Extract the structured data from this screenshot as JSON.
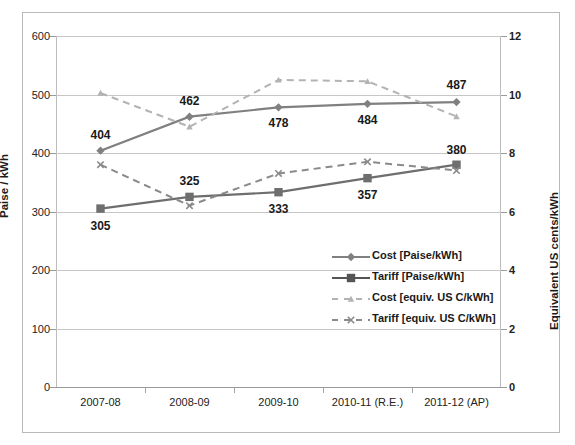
{
  "chart_data": {
    "type": "line",
    "title": "",
    "categories": [
      "2007-08",
      "2008-09",
      "2009-10",
      "2010-11 (R.E.)",
      "2011-12 (AP)"
    ],
    "xlabel": "",
    "ylabel": "Paise / kWh",
    "ylabel_secondary": "Equivalent US cents/kWh",
    "ylim": [
      0,
      600
    ],
    "ylim_secondary": [
      0,
      12
    ],
    "yticks": [
      0,
      100,
      200,
      300,
      400,
      500,
      600
    ],
    "yticks_secondary": [
      0,
      2,
      4,
      6,
      8,
      10,
      12
    ],
    "grid": true,
    "legend_position": "inside-lower-right",
    "series": [
      {
        "name": "Cost [Paise/kWh]",
        "axis": "primary",
        "style": "solid",
        "marker": "diamond",
        "color": "#808080",
        "values": [
          404,
          462,
          478,
          484,
          487
        ],
        "labels": [
          "404",
          "462",
          "478",
          "484",
          "487"
        ]
      },
      {
        "name": "Tariff [Paise/kWh]",
        "axis": "primary",
        "style": "solid",
        "marker": "square",
        "color": "#6e6e6e",
        "values": [
          305,
          325,
          333,
          357,
          380
        ],
        "labels": [
          "305",
          "325",
          "333",
          "357",
          "380"
        ]
      },
      {
        "name": "Cost [equiv. US C/kWh]",
        "axis": "secondary",
        "style": "dashed",
        "marker": "triangle",
        "color": "#b3b3b3",
        "values": [
          10.05,
          8.9,
          10.5,
          10.45,
          9.25
        ]
      },
      {
        "name": "Tariff [equiv. US C/kWh]",
        "axis": "secondary",
        "style": "dashed",
        "marker": "cross",
        "color": "#8a8a8a",
        "values": [
          7.6,
          6.2,
          7.3,
          7.7,
          7.4
        ]
      }
    ]
  },
  "axes": {
    "left_title": "Paise / kWh",
    "right_title": "Equivalent US cents/kWh",
    "left_ticks": [
      "600",
      "500",
      "400",
      "300",
      "200",
      "100",
      "0"
    ],
    "right_ticks": [
      "12",
      "10",
      "8",
      "6",
      "4",
      "2",
      "0"
    ],
    "x_ticks": [
      "2007-08",
      "2008-09",
      "2009-10",
      "2010-11 (R.E.)",
      "2011-12 (AP)"
    ]
  },
  "legend": {
    "items": [
      {
        "label": "Cost [Paise/kWh]",
        "marker": "diamond",
        "style": "solid",
        "color": "#808080"
      },
      {
        "label": "Tariff [Paise/kWh]",
        "marker": "square",
        "style": "solid",
        "color": "#555555"
      },
      {
        "label": "Cost [equiv. US C/kWh]",
        "marker": "triangle",
        "style": "dashed",
        "color": "#b3b3b3"
      },
      {
        "label": "Tariff [equiv. US C/kWh]",
        "marker": "cross",
        "style": "dashed",
        "color": "#8a8a8a"
      }
    ]
  }
}
